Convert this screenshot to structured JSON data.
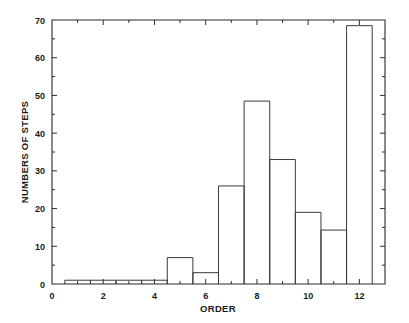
{
  "chart_data": {
    "type": "bar",
    "title": "",
    "subtitle": "",
    "xlabel": "ORDER",
    "ylabel": "NUMBERS OF STEPS",
    "xlim": [
      0,
      13
    ],
    "ylim": [
      0,
      70
    ],
    "grid": false,
    "legend": null,
    "bar_width": 1,
    "style": "histogram-outline",
    "x_ticks_major": [
      0,
      2,
      4,
      6,
      8,
      10,
      12
    ],
    "x_tick_labels": [
      "0",
      "2",
      "4",
      "6",
      "8",
      "10",
      "12"
    ],
    "x_ticks_minor": [
      1,
      3,
      5,
      7,
      9,
      11,
      13
    ],
    "y_ticks": [
      0,
      10,
      20,
      30,
      40,
      50,
      60,
      70
    ],
    "y_tick_labels": [
      "0",
      "10",
      "20",
      "30",
      "40",
      "50",
      "60",
      "70"
    ],
    "categories": [
      "1",
      "2",
      "3",
      "4",
      "5",
      "6",
      "7",
      "8",
      "9",
      "10",
      "11",
      "12"
    ],
    "bin_centers": [
      1,
      2,
      3,
      4,
      5,
      6,
      7,
      8,
      9,
      10,
      11,
      12
    ],
    "bin_edges": [
      0.5,
      1.5,
      2.5,
      3.5,
      4.5,
      5.5,
      6.5,
      7.5,
      8.5,
      9.5,
      10.5,
      11.5,
      12.5
    ],
    "values": [
      1,
      1,
      1,
      1,
      7,
      3,
      26,
      48.5,
      33,
      19,
      14.3,
      68.5
    ]
  },
  "axes": {
    "x_axis_label": "ORDER",
    "y_axis_label": "NUMBERS OF STEPS"
  },
  "colors": {
    "background": "#ffffff",
    "axis": "#2b2b2b",
    "bar_stroke": "#3a3a3a",
    "text": "#1a1a1a"
  }
}
